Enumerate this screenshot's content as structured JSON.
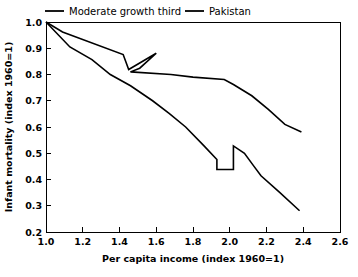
{
  "chart_data": {
    "type": "line",
    "title": "",
    "xlabel": "Per capita income (index 1960=1)",
    "ylabel": "Infant mortality (index 1960=1)",
    "xlim": [
      1.0,
      2.6
    ],
    "ylim": [
      0.2,
      1.0
    ],
    "xticks": [
      1.0,
      1.2,
      1.4,
      1.6,
      1.8,
      2.0,
      2.2,
      2.4,
      2.6
    ],
    "yticks": [
      0.2,
      0.3,
      0.4,
      0.5,
      0.6,
      0.7,
      0.8,
      0.9,
      1.0
    ],
    "xtick_labels": [
      "1.0",
      "1.2",
      "1.4",
      "1.6",
      "1.8",
      "2.0",
      "2.2",
      "2.4",
      "2.6"
    ],
    "ytick_labels": [
      "0.2",
      "0.3",
      "0.4",
      "0.5",
      "0.6",
      "0.7",
      "0.8",
      "0.9",
      "1.0"
    ],
    "grid": false,
    "legend_position": "above-plot",
    "line_color": "#000000",
    "series": [
      {
        "name": "Moderate growth third",
        "points": [
          [
            1.0,
            1.0
          ],
          [
            1.13,
            0.905
          ],
          [
            1.25,
            0.857
          ],
          [
            1.35,
            0.8
          ],
          [
            1.46,
            0.757
          ],
          [
            1.58,
            0.7
          ],
          [
            1.67,
            0.652
          ],
          [
            1.76,
            0.6
          ],
          [
            1.86,
            0.528
          ],
          [
            1.93,
            0.476
          ],
          [
            1.93,
            0.438
          ],
          [
            2.02,
            0.438
          ],
          [
            2.02,
            0.528
          ],
          [
            2.08,
            0.5
          ],
          [
            2.13,
            0.452
          ],
          [
            2.17,
            0.414
          ],
          [
            2.27,
            0.352
          ],
          [
            2.38,
            0.281
          ]
        ]
      },
      {
        "name": "Pakistan",
        "points": [
          [
            1.0,
            1.0
          ],
          [
            1.09,
            0.962
          ],
          [
            1.42,
            0.876
          ],
          [
            1.45,
            0.819
          ],
          [
            1.6,
            0.881
          ],
          [
            1.51,
            0.824
          ],
          [
            1.46,
            0.81
          ],
          [
            1.68,
            0.8
          ],
          [
            1.8,
            0.79
          ],
          [
            1.97,
            0.781
          ],
          [
            2.02,
            0.762
          ],
          [
            2.12,
            0.719
          ],
          [
            2.21,
            0.667
          ],
          [
            2.3,
            0.61
          ],
          [
            2.39,
            0.581
          ]
        ]
      }
    ],
    "legend": [
      {
        "label": "Moderate growth third"
      },
      {
        "label": "Pakistan"
      }
    ]
  }
}
